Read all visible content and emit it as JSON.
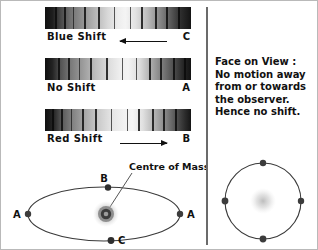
{
  "figure": {
    "title_text_absent": true
  },
  "spectra": [
    {
      "id": "blue-shift",
      "label": "Blue Shift",
      "letter": "C",
      "arrow_direction": "left",
      "lines_pct": [
        7,
        13,
        19,
        27,
        36,
        47,
        58,
        66,
        75,
        83,
        91
      ],
      "gradient_class": "grad-blue"
    },
    {
      "id": "no-shift",
      "label": "No Shift",
      "letter": "A",
      "arrow_direction": "none",
      "lines_pct": [
        9,
        16,
        23,
        31,
        42,
        53,
        62,
        71,
        79,
        88,
        95
      ],
      "gradient_class": "grad-no"
    },
    {
      "id": "red-shift",
      "label": "Red Shift",
      "letter": "B",
      "arrow_direction": "right",
      "lines_pct": [
        5,
        11,
        18,
        25,
        34,
        45,
        56,
        64,
        73,
        81,
        89
      ],
      "gradient_class": "grad-red"
    }
  ],
  "right_panel": {
    "lines": [
      "Face on View :",
      "No motion away",
      "from or towards",
      "the observer.",
      "Hence no shift."
    ]
  },
  "orbit_diagram": {
    "centre_of_mass_label": "Centre of Mass",
    "point_labels": {
      "top": "B",
      "bottom": "C",
      "left": "A",
      "right": "A"
    }
  },
  "face_on_diagram": {
    "points": 4
  },
  "colors": {
    "ink": "#111111",
    "divider": "#6b6b6b",
    "orbit_stroke": "#3a3a3a",
    "body_dot": "#444444",
    "background": "#ffffff"
  }
}
